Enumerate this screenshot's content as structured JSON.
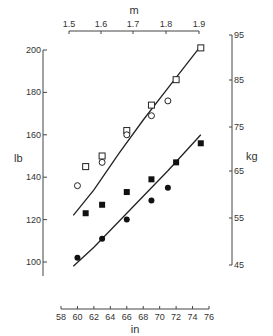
{
  "chart_data": {
    "type": "scatter",
    "title": "",
    "xlabel": "in",
    "ylabel": "lb",
    "x2label": "m",
    "y2label": "kg",
    "xlim": [
      58,
      76
    ],
    "ylim": [
      90,
      205
    ],
    "x_ticks": [
      58,
      60,
      62,
      64,
      66,
      68,
      70,
      72,
      74,
      76
    ],
    "y_ticks": [
      100,
      120,
      140,
      160,
      180,
      200
    ],
    "x2_ticks": [
      "1.5",
      "1.6",
      "1.7",
      "1.8",
      "1.9"
    ],
    "y2_ticks": [
      "95",
      "85",
      "75",
      "65",
      "55",
      "45"
    ],
    "grid": false,
    "legend": "none",
    "series": [
      {
        "name": "open-squares",
        "marker": "square-open",
        "points": [
          [
            61,
            145
          ],
          [
            63,
            150
          ],
          [
            66,
            162
          ],
          [
            69,
            174
          ],
          [
            72,
            186
          ],
          [
            75,
            201
          ]
        ]
      },
      {
        "name": "open-circles",
        "marker": "circle-open",
        "points": [
          [
            60,
            136
          ],
          [
            63,
            147
          ],
          [
            66,
            160
          ],
          [
            69,
            169
          ],
          [
            71,
            176
          ]
        ]
      },
      {
        "name": "filled-squares",
        "marker": "square-filled",
        "points": [
          [
            61,
            123
          ],
          [
            63,
            127
          ],
          [
            66,
            133
          ],
          [
            69,
            139
          ],
          [
            72,
            147
          ],
          [
            75,
            156
          ]
        ]
      },
      {
        "name": "filled-circles",
        "marker": "circle-filled",
        "points": [
          [
            60,
            102
          ],
          [
            63,
            111
          ],
          [
            66,
            120
          ],
          [
            69,
            129
          ],
          [
            71,
            135
          ]
        ]
      }
    ],
    "curves": [
      {
        "name": "upper-fit",
        "points": [
          [
            59.5,
            122
          ],
          [
            62,
            134
          ],
          [
            65,
            151
          ],
          [
            68,
            167
          ],
          [
            71,
            182
          ],
          [
            75,
            202
          ]
        ]
      },
      {
        "name": "lower-fit",
        "points": [
          [
            59.5,
            98
          ],
          [
            62,
            107
          ],
          [
            65,
            119
          ],
          [
            68,
            131
          ],
          [
            71,
            143
          ],
          [
            75,
            160
          ]
        ]
      }
    ]
  }
}
